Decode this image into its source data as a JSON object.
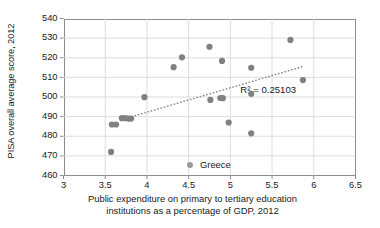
{
  "chart_data": {
    "type": "scatter",
    "title": "",
    "xlabel": "Public expenditure on primary to tertiary education institutions as a percentage of GDP, 2012",
    "xlabel_line1": "Public expenditure on primary to tertiary education",
    "xlabel_line2": "institutions as a percentage of GDP, 2012",
    "ylabel": "PISA overall average score, 2012",
    "xlim": [
      3,
      6.5
    ],
    "ylim": [
      460,
      540
    ],
    "xticks": [
      "3",
      "3.5",
      "4",
      "4.5",
      "5",
      "5.5",
      "6",
      "6.5"
    ],
    "xtick_values": [
      3,
      3.5,
      4,
      4.5,
      5,
      5.5,
      6,
      6.5
    ],
    "yticks": [
      "460",
      "470",
      "480",
      "490",
      "500",
      "510",
      "520",
      "530",
      "540"
    ],
    "ytick_values": [
      460,
      470,
      480,
      490,
      500,
      510,
      520,
      530,
      540
    ],
    "grid": true,
    "grid_color": "#d9d9d9",
    "marker_color": "#808080",
    "legend": {
      "position": "inside-bottom-center",
      "entries": [
        {
          "label": "Greece",
          "marker": "circle",
          "color": "#999999"
        }
      ]
    },
    "annotations": [
      {
        "name": "r-squared",
        "text": "R² = 0.25103",
        "x": 5.12,
        "y": 504
      }
    ],
    "trendline": {
      "style": "dotted",
      "color": "#8c8c8c",
      "x_start": 3.74,
      "y_start": 489.0,
      "x_end": 5.86,
      "y_end": 515.4,
      "r_squared": 0.25103
    },
    "series": [
      {
        "name": "Greece",
        "color": "#808080",
        "points": [
          {
            "x": 3.57,
            "y": 472.0
          },
          {
            "x": 3.58,
            "y": 486.0
          },
          {
            "x": 3.63,
            "y": 486.0
          },
          {
            "x": 3.7,
            "y": 489.2
          },
          {
            "x": 3.74,
            "y": 489.2
          },
          {
            "x": 3.78,
            "y": 489.0
          },
          {
            "x": 3.81,
            "y": 489.0
          },
          {
            "x": 3.97,
            "y": 499.9
          },
          {
            "x": 4.32,
            "y": 515.2
          },
          {
            "x": 4.42,
            "y": 520.2
          },
          {
            "x": 4.75,
            "y": 525.6
          },
          {
            "x": 4.76,
            "y": 498.5
          },
          {
            "x": 4.88,
            "y": 499.5
          },
          {
            "x": 4.91,
            "y": 499.4
          },
          {
            "x": 4.9,
            "y": 518.4
          },
          {
            "x": 4.98,
            "y": 487.0
          },
          {
            "x": 5.25,
            "y": 481.5
          },
          {
            "x": 5.25,
            "y": 514.9
          },
          {
            "x": 5.25,
            "y": 501.6
          },
          {
            "x": 5.72,
            "y": 529.1
          },
          {
            "x": 5.87,
            "y": 508.6
          }
        ]
      }
    ]
  }
}
